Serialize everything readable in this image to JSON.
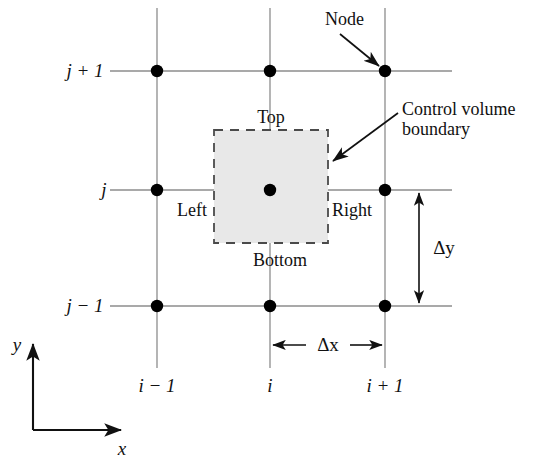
{
  "figure": {
    "type": "diagram",
    "width": 540,
    "height": 460,
    "background_color": "#ffffff",
    "line_color": "#808080",
    "node_color": "#000000",
    "dash_color": "#555555",
    "fill_color": "#e8e8e8",
    "text_color": "#111111"
  },
  "row_labels": [
    {
      "name": "j-plus-1",
      "text": "j + 1",
      "y": 71
    },
    {
      "name": "j",
      "text": "j",
      "y": 190
    },
    {
      "name": "j-minus-1",
      "text": "j − 1",
      "y": 306
    }
  ],
  "column_labels": [
    {
      "name": "i-minus-1",
      "text": "i − 1",
      "x": 157
    },
    {
      "name": "i",
      "text": "i",
      "x": 270
    },
    {
      "name": "i-plus-1",
      "text": "i + 1",
      "x": 385
    }
  ],
  "face_labels": [
    {
      "name": "top",
      "text": "Top",
      "x": 271,
      "y": 117
    },
    {
      "name": "left",
      "text": "Left",
      "x": 192,
      "y": 210
    },
    {
      "name": "right",
      "text": "Right",
      "x": 352,
      "y": 210
    },
    {
      "name": "bottom",
      "text": "Bottom",
      "x": 280,
      "y": 260
    }
  ],
  "callouts": [
    {
      "name": "node",
      "text": "Node",
      "x": 346,
      "y": 19
    },
    {
      "name": "control-volume-boundary",
      "line1": "Control volume",
      "line2": "boundary",
      "x": 402,
      "y": 101
    }
  ],
  "dimensions": [
    {
      "name": "delta-x",
      "symbol": "Δx",
      "axis": "horizontal",
      "from": 270,
      "to": 385,
      "at": 345
    },
    {
      "name": "delta-y",
      "symbol": "Δy",
      "axis": "vertical",
      "from": 190,
      "to": 306,
      "at": 419
    }
  ],
  "axes": [
    {
      "name": "x-axis",
      "label": "x",
      "label_x": 122,
      "label_y": 449
    },
    {
      "name": "y-axis",
      "label": "y",
      "label_x": 17,
      "label_y": 345
    }
  ],
  "nodes": [
    {
      "name": "node-i-1-j-1",
      "x": 157,
      "y": 71
    },
    {
      "name": "node-i-j-1",
      "x": 270,
      "y": 71
    },
    {
      "name": "node-i+1-j-1",
      "x": 385,
      "y": 71
    },
    {
      "name": "node-i-1-j",
      "x": 157,
      "y": 190
    },
    {
      "name": "node-i-j",
      "x": 270,
      "y": 190
    },
    {
      "name": "node-i+1-j",
      "x": 385,
      "y": 190
    },
    {
      "name": "node-i-1-j-m1",
      "x": 157,
      "y": 306
    },
    {
      "name": "node-i-j-m1",
      "x": 270,
      "y": 306
    },
    {
      "name": "node-i+1-j-m1",
      "x": 385,
      "y": 306
    }
  ],
  "control_volume": {
    "name": "control-volume",
    "left": 214,
    "top": 130,
    "right": 328,
    "bottom": 243
  }
}
